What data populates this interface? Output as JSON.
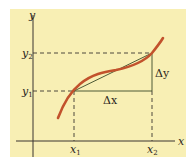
{
  "diagram": {
    "title": "",
    "colors": {
      "background_panel": "#f8efb4",
      "axes": "#3a3530",
      "curve": "#c2522c",
      "secant": "#4a5a30",
      "guide_lines": "#3a3530"
    },
    "axes": {
      "x_label": "x",
      "y_label": "y"
    },
    "points": {
      "x1_label": "x",
      "x1_sub": "1",
      "x2_label": "x",
      "x2_sub": "2",
      "y1_label": "y",
      "y1_sub": "1",
      "y2_label": "y",
      "y2_sub": "2"
    },
    "annotations": {
      "delta_x": "Δx",
      "delta_y": "Δy"
    }
  }
}
